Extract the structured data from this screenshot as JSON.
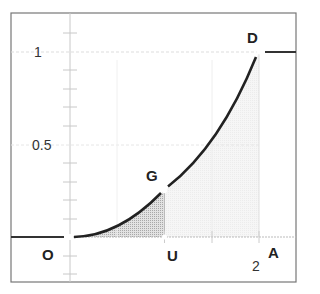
{
  "diagram": {
    "points": {
      "O": "O",
      "G": "G",
      "D": "D",
      "U": "U",
      "A": "A"
    },
    "y_ticks": [
      "1",
      "0.5"
    ],
    "x_ticks": [
      "2"
    ],
    "colors": {
      "curve": "#222222",
      "shade_dark": "#c8c8c8",
      "shade_light": "#f0f0f0",
      "grid": "#d8d8d8"
    }
  }
}
